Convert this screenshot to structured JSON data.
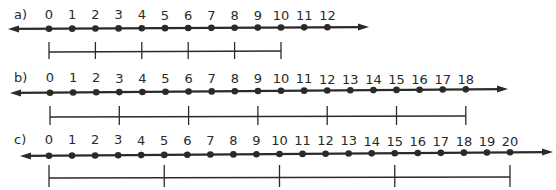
{
  "number_lines": [
    {
      "label": "a)",
      "label_x": 14,
      "values": [
        0,
        1,
        2,
        3,
        4,
        5,
        6,
        7,
        8,
        9,
        10,
        11,
        12
      ],
      "x0": 49,
      "step": 23.2,
      "axis_y_left": 29,
      "axis_y_right": 27,
      "arrow_left_x": 8,
      "arrow_right_x": 369,
      "number_y": 19,
      "segment": {
        "ticks": [
          0,
          2,
          4,
          6,
          8,
          10
        ],
        "y": 52,
        "tick_top": 42,
        "tick_bottom": 59
      }
    },
    {
      "label": "b)",
      "label_x": 14,
      "values": [
        0,
        1,
        2,
        3,
        4,
        5,
        6,
        7,
        8,
        9,
        10,
        11,
        12,
        13,
        14,
        15,
        16,
        17,
        18
      ],
      "x0": 50,
      "step": 23.1,
      "axis_y_left": 93,
      "axis_y_right": 89,
      "arrow_left_x": 10,
      "arrow_right_x": 508,
      "number_y": 82,
      "segment": {
        "ticks": [
          0,
          3,
          6,
          9,
          12,
          15,
          18
        ],
        "y": 117,
        "tick_top": 106,
        "tick_bottom": 125
      }
    },
    {
      "label": "c)",
      "label_x": 14,
      "values": [
        0,
        1,
        2,
        3,
        4,
        5,
        6,
        7,
        8,
        9,
        10,
        11,
        12,
        13,
        14,
        15,
        16,
        17,
        18,
        19,
        20
      ],
      "x0": 49,
      "step": 23.05,
      "axis_y_left": 156,
      "axis_y_right": 152,
      "arrow_left_x": 20,
      "arrow_right_x": 553,
      "number_y": 144,
      "segment": {
        "ticks": [
          0,
          5,
          10,
          15,
          20
        ],
        "y": 178,
        "tick_top": 165,
        "tick_bottom": 187
      }
    }
  ],
  "colors": {
    "ink": "#2a2a2a",
    "background": "#ffffff"
  }
}
